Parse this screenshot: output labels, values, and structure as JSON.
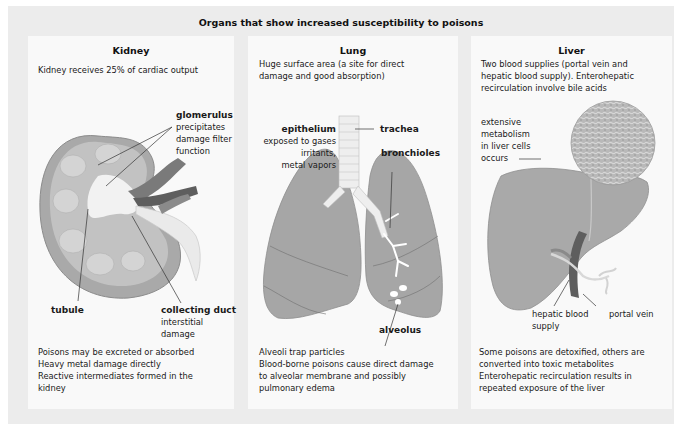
{
  "title": "Organs that show increased susceptibility to poisons",
  "panels": {
    "kidney": {
      "title": "Kidney",
      "intro": "Kidney receives  25% of cardiac output",
      "labels": {
        "glomerulus": {
          "name": "glomerulus",
          "desc": [
            "precipitates",
            "damage filter",
            "function"
          ]
        },
        "tubule": {
          "name": "tubule"
        },
        "collecting_duct": {
          "name": "collecting duct",
          "desc": [
            "interstitial",
            "damage"
          ]
        }
      },
      "notes": [
        "Poisons may be excreted or absorbed",
        "Heavy metal damage directly",
        "Reactive intermediates formed in the",
        "kidney"
      ]
    },
    "lung": {
      "title": "Lung",
      "intro": [
        "Huge surface area (a site for direct",
        "damage and good absorption)"
      ],
      "labels": {
        "epithelium": {
          "name": "epithelium",
          "desc": [
            "exposed to gases",
            "irritants,",
            "metal vapors"
          ]
        },
        "trachea": {
          "name": "trachea"
        },
        "bronchioles": {
          "name": "bronchioles"
        },
        "alveolus": {
          "name": "alveolus"
        }
      },
      "notes": [
        "Alveoli trap particles",
        "Blood-borne poisons cause direct damage",
        "to alveolar membrane and possibly",
        "pulmonary edema"
      ]
    },
    "liver": {
      "title": "Liver",
      "intro": [
        "Two blood supplies (portal vein and",
        "hepatic blood supply). Enterohepatic",
        "recirculation involve bile acids"
      ],
      "labels": {
        "metabolism": {
          "desc": [
            "extensive",
            "metabolism",
            "in liver cells",
            "occurs"
          ]
        },
        "hepatic_blood_supply": {
          "name": [
            "hepatic blood",
            "supply"
          ]
        },
        "portal_vein": {
          "name": "portal vein"
        }
      },
      "notes": [
        "Some poisons are detoxified, others are",
        "converted into toxic metabolites",
        "Enterohepatic recirculation results in",
        "repeated exposure of the liver"
      ]
    }
  },
  "colors": {
    "background": "#ececec",
    "panel": "#f9f9f9",
    "organ_gray": "#a8a8a8",
    "organ_dark": "#8a8a8a",
    "vessel_dark": "#5e5e5e"
  }
}
